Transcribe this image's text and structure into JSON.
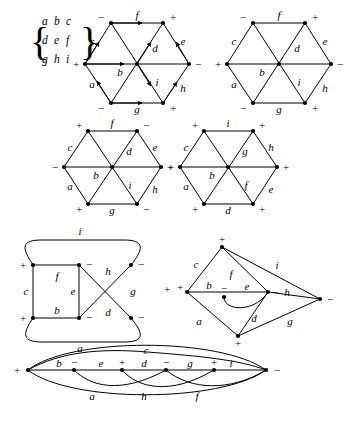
{
  "figure": {
    "matrix": {
      "rows": [
        [
          "a",
          "b",
          "c"
        ],
        [
          "d",
          "e",
          "f"
        ],
        [
          "g",
          "h",
          "i"
        ]
      ],
      "left_brace": "{",
      "right_brace": "}"
    },
    "diagrams": [
      {
        "id": "hex-1",
        "type": "hexagon-oriented",
        "has_arrows": true,
        "vertex_signs": {
          "top_left": "−",
          "top_right": "+",
          "right": "−",
          "bottom_right": "+",
          "bottom_left": "−",
          "left": "+"
        },
        "edge_labels": {
          "top": "f",
          "upper_left": "c",
          "upper_right": "e",
          "lower_left": "a",
          "lower_right": "h",
          "bottom": "g",
          "middle_horizontal": "b",
          "diag_upper": "d",
          "diag_lower": "i"
        }
      },
      {
        "id": "hex-2",
        "type": "hexagon-plain",
        "has_arrows": false,
        "vertex_signs": {
          "top_left": "−",
          "top_right": "+",
          "right": "−",
          "bottom_right": "+",
          "bottom_left": "−",
          "left": "+"
        },
        "edge_labels": {
          "top": "f",
          "upper_left": "c",
          "upper_right": "e",
          "lower_left": "a",
          "lower_right": "h",
          "bottom": "g",
          "middle_horizontal": "b",
          "diag_upper": "d",
          "diag_lower": "i"
        }
      },
      {
        "id": "hex-3",
        "type": "hexagon-plain",
        "has_arrows": false,
        "vertex_signs": {
          "top_left": "+",
          "top_right": "−",
          "right": "+",
          "bottom_right": "−",
          "bottom_left": "+",
          "left": "−"
        },
        "edge_labels": {
          "top": "f",
          "upper_left": "c",
          "upper_right": "e",
          "lower_left": "a",
          "lower_right": "h",
          "bottom": "g",
          "middle_horizontal": "b",
          "diag_upper": "d",
          "diag_lower": "i"
        }
      },
      {
        "id": "hex-4",
        "type": "hexagon-plain",
        "has_arrows": false,
        "vertex_signs": {
          "top_left": "+",
          "top_right": "+",
          "right": "+",
          "bottom_right": "+",
          "bottom_left": "+",
          "left": "+"
        },
        "edge_labels": {
          "top": "i",
          "upper_left": "c",
          "upper_right": "h",
          "lower_left": "a",
          "lower_right": "e",
          "bottom": "d",
          "middle_horizontal": "b",
          "diag_upper": "g",
          "diag_lower": "f"
        }
      },
      {
        "id": "ladder-5",
        "type": "ladder-with-loops",
        "vertex_signs": {
          "top_left": "+",
          "top_mid": "−",
          "top_right": "−",
          "bottom_left": "+",
          "bottom_mid": "−",
          "bottom_right": "−",
          "far_right": "+"
        },
        "edge_labels": {
          "top_arc": "i",
          "bottom_arc": "a",
          "left_vertical": "c",
          "mid_vertical": "e",
          "top_horizontal": "f",
          "bottom_horizontal": "b",
          "cross_upper": "h",
          "cross_lower": "d",
          "right_side": "g"
        }
      },
      {
        "id": "kite-6",
        "type": "kite-network",
        "vertex_signs": {
          "top": "+",
          "left": "+",
          "center_left": "−",
          "center_right": "−",
          "right": "−",
          "bottom": "+"
        },
        "edge_labels": {
          "upper_left": "c",
          "inner_f": "f",
          "upper_right": "i",
          "mid_left": "b",
          "mid_center": "e",
          "mid_right": "h",
          "lower_left": "a",
          "lower_mid": "d",
          "lower_right": "g"
        }
      },
      {
        "id": "lens-7",
        "type": "lens-network",
        "vertex_signs": {
          "left": "+",
          "v1": "−",
          "v2": "+",
          "v3": "−",
          "v4": "+",
          "right": "−"
        },
        "edge_labels": {
          "top_arc": "c",
          "line_1": "b",
          "line_2": "e",
          "line_3": "d",
          "line_4": "g",
          "line_5": "i",
          "bottom_arc_1": "a",
          "bottom_arc_2": "h",
          "bottom_arc_3": "f"
        }
      }
    ],
    "colors": {
      "ink": "#000000",
      "background": "#ffffff"
    }
  }
}
